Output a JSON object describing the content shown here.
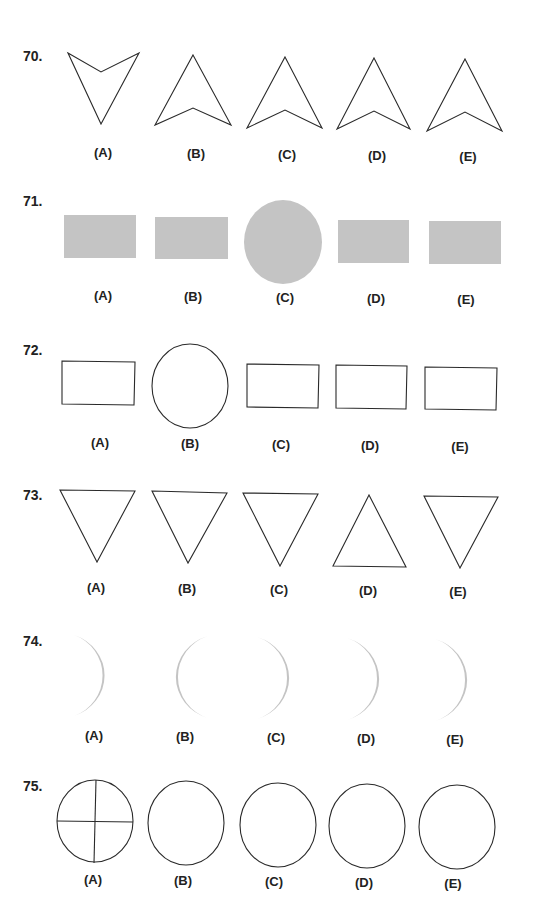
{
  "page": {
    "fill_color": "#c4c4c4",
    "stroke_color": "#2a2a2a"
  },
  "questions": [
    {
      "number": "70.",
      "options": [
        {
          "label": "(A)",
          "shape": "arrowhead-pointing-down"
        },
        {
          "label": "(B)",
          "shape": "arrowhead-pointing-up"
        },
        {
          "label": "(C)",
          "shape": "arrowhead-pointing-up"
        },
        {
          "label": "(D)",
          "shape": "arrowhead-pointing-up"
        },
        {
          "label": "(E)",
          "shape": "arrowhead-pointing-up"
        }
      ]
    },
    {
      "number": "71.",
      "options": [
        {
          "label": "(A)",
          "shape": "filled-rectangle"
        },
        {
          "label": "(B)",
          "shape": "filled-rectangle"
        },
        {
          "label": "(C)",
          "shape": "filled-circle"
        },
        {
          "label": "(D)",
          "shape": "filled-rectangle"
        },
        {
          "label": "(E)",
          "shape": "filled-rectangle"
        }
      ]
    },
    {
      "number": "72.",
      "options": [
        {
          "label": "(A)",
          "shape": "rectangle-outline"
        },
        {
          "label": "(B)",
          "shape": "circle-outline"
        },
        {
          "label": "(C)",
          "shape": "rectangle-outline"
        },
        {
          "label": "(D)",
          "shape": "rectangle-outline"
        },
        {
          "label": "(E)",
          "shape": "rectangle-outline"
        }
      ]
    },
    {
      "number": "73.",
      "options": [
        {
          "label": "(A)",
          "shape": "triangle-pointing-down"
        },
        {
          "label": "(B)",
          "shape": "triangle-pointing-down"
        },
        {
          "label": "(C)",
          "shape": "triangle-pointing-down"
        },
        {
          "label": "(D)",
          "shape": "triangle-pointing-up"
        },
        {
          "label": "(E)",
          "shape": "triangle-pointing-down"
        }
      ]
    },
    {
      "number": "74.",
      "options": [
        {
          "label": "(A)",
          "shape": "crescent-opening-left"
        },
        {
          "label": "(B)",
          "shape": "crescent-opening-right"
        },
        {
          "label": "(C)",
          "shape": "crescent-opening-left"
        },
        {
          "label": "(D)",
          "shape": "crescent-opening-left"
        },
        {
          "label": "(E)",
          "shape": "crescent-opening-left"
        }
      ]
    },
    {
      "number": "75.",
      "options": [
        {
          "label": "(A)",
          "shape": "circle-with-cross"
        },
        {
          "label": "(B)",
          "shape": "circle-outline"
        },
        {
          "label": "(C)",
          "shape": "circle-outline"
        },
        {
          "label": "(D)",
          "shape": "circle-outline"
        },
        {
          "label": "(E)",
          "shape": "circle-outline"
        }
      ]
    }
  ]
}
